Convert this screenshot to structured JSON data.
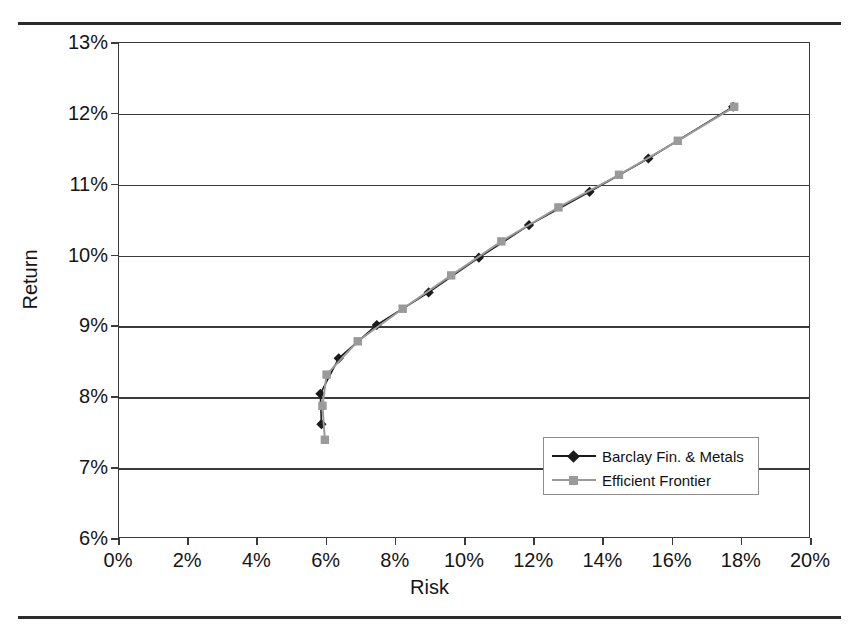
{
  "figure": {
    "rules": [
      "top-rule",
      "bottom-rule"
    ]
  },
  "axes": {
    "x_title": "Risk",
    "y_title": "Return",
    "x_ticks": [
      "0%",
      "2%",
      "4%",
      "6%",
      "8%",
      "10%",
      "12%",
      "14%",
      "16%",
      "18%",
      "20%"
    ],
    "y_ticks": [
      "6%",
      "7%",
      "8%",
      "9%",
      "10%",
      "11%",
      "12%",
      "13%"
    ]
  },
  "legend": {
    "items": [
      {
        "label": "Barclay Fin. & Metals",
        "color": "#1b1b1b",
        "marker": "diamond"
      },
      {
        "label": "Efficient Frontier",
        "color": "#9a9a9a",
        "marker": "square"
      }
    ]
  },
  "chart_data": {
    "type": "line",
    "title": "",
    "xlabel": "Risk",
    "ylabel": "Return",
    "xlim": [
      0,
      20
    ],
    "ylim": [
      6,
      13
    ],
    "xtick_step": 2,
    "ytick_step": 1,
    "grid": true,
    "legend_position": "inside-lower-right",
    "series": [
      {
        "name": "Barclay Fin. & Metals",
        "color": "#1b1b1b",
        "marker": "diamond",
        "points": [
          [
            5.85,
            7.62
          ],
          [
            5.82,
            8.05
          ],
          [
            6.35,
            8.55
          ],
          [
            7.45,
            9.02
          ],
          [
            8.95,
            9.48
          ],
          [
            10.4,
            9.97
          ],
          [
            11.85,
            10.43
          ],
          [
            13.6,
            10.9
          ],
          [
            15.3,
            11.37
          ],
          [
            17.75,
            12.1
          ]
        ]
      },
      {
        "name": "Efficient Frontier",
        "color": "#9a9a9a",
        "marker": "square",
        "points": [
          [
            5.95,
            7.4
          ],
          [
            5.88,
            7.88
          ],
          [
            6.0,
            8.32
          ],
          [
            6.9,
            8.79
          ],
          [
            8.2,
            9.25
          ],
          [
            9.6,
            9.72
          ],
          [
            11.05,
            10.2
          ],
          [
            12.7,
            10.68
          ],
          [
            14.45,
            11.14
          ],
          [
            16.15,
            11.62
          ],
          [
            17.78,
            12.1
          ]
        ]
      }
    ]
  }
}
